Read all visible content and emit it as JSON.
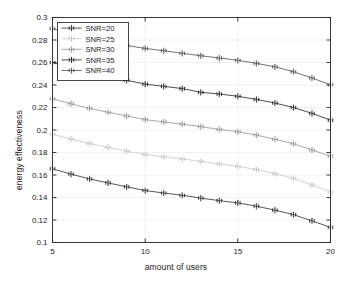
{
  "chart_data": {
    "type": "line",
    "title": "",
    "xlabel": "amount of users",
    "ylabel": "energy effectiveness",
    "xlim": [
      5,
      20
    ],
    "ylim": [
      0.1,
      0.3
    ],
    "xticks": [
      5,
      10,
      15,
      20
    ],
    "xticklabels": [
      "5",
      "10",
      "15",
      "20"
    ],
    "yticks": [
      0.1,
      0.12,
      0.14,
      0.16,
      0.18,
      0.2,
      0.22,
      0.24,
      0.26,
      0.28,
      0.3
    ],
    "yticklabels": [
      "0.1",
      "0.12",
      "0.14",
      "0.16",
      "0.18",
      "0.2",
      "0.22",
      "0.24",
      "0.26",
      "0.28",
      "0.3"
    ],
    "grid": true,
    "legend_position": "upper left",
    "marker": "asterisk",
    "x": [
      5,
      6,
      7,
      8,
      9,
      10,
      11,
      12,
      13,
      14,
      15,
      16,
      17,
      18,
      19,
      20
    ],
    "series": [
      {
        "name": "SNR=20",
        "color": "#3a3a3a",
        "values": [
          0.1655,
          0.1608,
          0.1565,
          0.153,
          0.1495,
          0.1462,
          0.144,
          0.142,
          0.1395,
          0.1372,
          0.1352,
          0.1323,
          0.1288,
          0.1248,
          0.1192,
          0.1135
        ]
      },
      {
        "name": "SNR=25",
        "color": "#c9c9c9",
        "values": [
          0.1962,
          0.192,
          0.188,
          0.1845,
          0.1812,
          0.1782,
          0.1762,
          0.1742,
          0.1722,
          0.1698,
          0.1678,
          0.1648,
          0.1612,
          0.157,
          0.1512,
          0.1448
        ]
      },
      {
        "name": "SNR=30",
        "color": "#9a9a9a",
        "values": [
          0.2278,
          0.2232,
          0.2192,
          0.2158,
          0.2125,
          0.2092,
          0.2072,
          0.2052,
          0.203,
          0.2005,
          0.1985,
          0.1955,
          0.1918,
          0.1878,
          0.1822,
          0.1768
        ]
      },
      {
        "name": "SNR=35",
        "color": "#2e2e2e",
        "values": [
          0.26,
          0.2555,
          0.2515,
          0.2478,
          0.2442,
          0.2408,
          0.2388,
          0.2368,
          0.2335,
          0.232,
          0.23,
          0.2272,
          0.224,
          0.22,
          0.2148,
          0.2088
        ]
      },
      {
        "name": "SNR=40",
        "color": "#5a5a5a",
        "values": [
          0.29,
          0.2862,
          0.2825,
          0.2792,
          0.2752,
          0.2725,
          0.2705,
          0.2682,
          0.266,
          0.264,
          0.262,
          0.2592,
          0.2562,
          0.2518,
          0.2462,
          0.2402
        ]
      }
    ]
  },
  "figure": {
    "background": "#ffffff",
    "axis_color": "#262626",
    "grid_color": "#ebebeb"
  }
}
